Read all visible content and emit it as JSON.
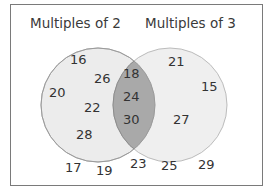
{
  "diagram": {
    "type": "venn",
    "sets": [
      {
        "label": "Multiples of 2",
        "only": [
          "16",
          "26",
          "20",
          "22",
          "28"
        ]
      },
      {
        "label": "Multiples of 3",
        "only": [
          "21",
          "15",
          "27"
        ]
      }
    ],
    "intersection": [
      "18",
      "24",
      "30"
    ],
    "outside": [
      "17",
      "19",
      "23",
      "25",
      "29"
    ],
    "colors": {
      "circle_fill": "#ececec",
      "circle_stroke": "#bcbcbc",
      "intersection_fill": "#a9a9a9",
      "frame": "#7a7a7a",
      "text": "#333333"
    }
  }
}
